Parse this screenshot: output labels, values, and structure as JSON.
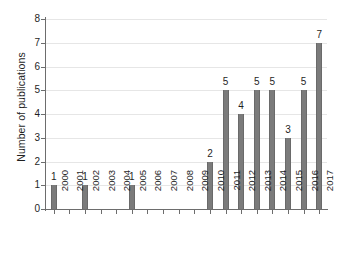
{
  "chart_data": {
    "type": "bar",
    "title": "",
    "subtitle": "",
    "xlabel": "",
    "ylabel": "Number of publications",
    "categories": [
      "2000",
      "2001",
      "2002",
      "2003",
      "2004",
      "2005",
      "2006",
      "2007",
      "2008",
      "2009",
      "2010",
      "2011",
      "2012",
      "2013",
      "2014",
      "2015",
      "2016",
      "2017"
    ],
    "values": [
      1,
      0,
      1,
      0,
      0,
      1,
      0,
      0,
      0,
      0,
      2,
      5,
      4,
      5,
      5,
      3,
      5,
      7
    ],
    "data_labels": [
      "1",
      "",
      "1",
      "",
      "",
      "1",
      "",
      "",
      "",
      "",
      "2",
      "5",
      "4",
      "5",
      "5",
      "3",
      "5",
      "7"
    ],
    "ylim": [
      0,
      8
    ],
    "y_ticks": [
      0,
      1,
      2,
      3,
      4,
      5,
      6,
      7,
      8
    ],
    "y_tick_labels": [
      "0",
      "1",
      "2",
      "3",
      "4",
      "5",
      "6",
      "7",
      "8"
    ],
    "grid": true,
    "grid_axis": "y",
    "legend": false,
    "legend_position": "none",
    "series": [
      {
        "name": "Number of publications",
        "values": [
          1,
          0,
          1,
          0,
          0,
          1,
          0,
          0,
          0,
          0,
          2,
          5,
          4,
          5,
          5,
          3,
          5,
          7
        ]
      }
    ],
    "colors": {
      "bar_fill": "#7b7b7b",
      "bar_edge": "#6a6a6a",
      "gridline": "#e6e6e6",
      "axis": "#6d6d6d",
      "text": "#1f1f1f",
      "background": "#ffffff"
    }
  }
}
